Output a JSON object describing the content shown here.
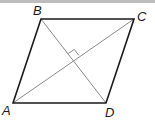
{
  "diagram": {
    "type": "rhombus",
    "vertices": {
      "A": {
        "label": "A",
        "x": 13,
        "y": 103
      },
      "B": {
        "label": "B",
        "x": 41,
        "y": 19
      },
      "C": {
        "label": "C",
        "x": 134,
        "y": 19
      },
      "D": {
        "label": "D",
        "x": 106,
        "y": 103
      }
    },
    "sides": [
      "AB",
      "BC",
      "CD",
      "DA"
    ],
    "diagonals": [
      "AC",
      "BD"
    ],
    "annotations": [
      {
        "type": "right-angle-marker",
        "at": "intersection of AC and BD"
      }
    ],
    "colors": {
      "side": "#1a1a1a",
      "diagonal": "#8a8a8a",
      "top_rule": "#bdbdbd"
    }
  }
}
